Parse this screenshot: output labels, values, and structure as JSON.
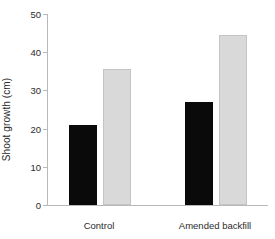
{
  "chart_data": {
    "type": "bar",
    "title": "",
    "xlabel": "",
    "ylabel": "Shoot growth (cm)",
    "categories": [
      "Control",
      "Amended backfill"
    ],
    "series": [
      {
        "name": "dark",
        "color": "#0a0a0a",
        "values": [
          21,
          27
        ]
      },
      {
        "name": "light",
        "color": "#d9d9d9",
        "values": [
          35.5,
          44.5
        ]
      }
    ],
    "ylim": [
      0,
      50
    ],
    "yticks": [
      0,
      10,
      20,
      30,
      40,
      50
    ],
    "ytick_labels": [
      "0",
      "10",
      "20",
      "30",
      "40",
      "50"
    ],
    "grid": false,
    "legend": "none"
  },
  "axis": {
    "y_title": "Shoot growth (cm)",
    "tick_0": "0",
    "tick_10": "10",
    "tick_20": "20",
    "tick_30": "30",
    "tick_40": "40",
    "tick_50": "50"
  },
  "categories": {
    "cat_0": "Control",
    "cat_1": "Amended backfill"
  }
}
